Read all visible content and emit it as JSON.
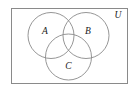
{
  "figure": {
    "type": "venn-diagram",
    "title": "",
    "background_color": "#ffffff",
    "width": 137,
    "height": 91
  },
  "universe": {
    "label": "U",
    "label_x": 118,
    "label_y": 16,
    "rect": {
      "x": 11,
      "y": 8,
      "width": 117,
      "height": 76
    },
    "stroke_color": "#8a8a8a",
    "stroke_width": 1,
    "fill": "none"
  },
  "circles": [
    {
      "label": "A",
      "cx": 51,
      "cy": 35.5,
      "r": 23,
      "label_x": 45,
      "label_y": 32,
      "stroke_color": "#8a8a8a",
      "stroke_width": 0.9,
      "fill": "none"
    },
    {
      "label": "B",
      "cx": 86,
      "cy": 35.5,
      "r": 23,
      "label_x": 88,
      "label_y": 32,
      "stroke_color": "#8a8a8a",
      "stroke_width": 0.9,
      "fill": "none"
    },
    {
      "label": "C",
      "cx": 68.5,
      "cy": 57,
      "r": 23,
      "label_x": 68.5,
      "label_y": 67,
      "stroke_color": "#8a8a8a",
      "stroke_width": 0.9,
      "fill": "none"
    }
  ]
}
